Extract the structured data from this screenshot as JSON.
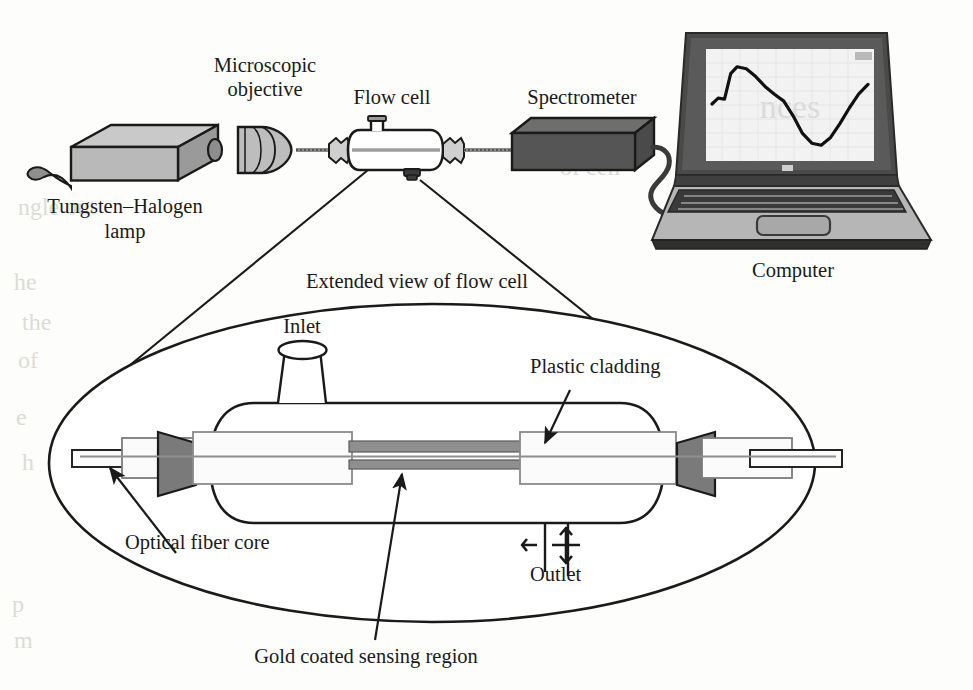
{
  "figure": {
    "domain": "scientific-diagram"
  },
  "labels": {
    "lamp": "Tungsten–Halogen",
    "lamp_line2": "lamp",
    "objective": "Microscopic",
    "objective_line2": "objective",
    "flow_cell": "Flow cell",
    "spectrometer": "Spectrometer",
    "computer": "Computer",
    "extended_view": "Extended view of flow cell",
    "inlet": "Inlet",
    "outlet": "Outlet",
    "plastic_cladding": "Plastic cladding",
    "optical_fiber_core": "Optical fiber core",
    "gold_region": "Gold coated sensing region"
  },
  "components": [
    {
      "id": "lamp",
      "name": "Tungsten–Halogen lamp",
      "kind": "light-source"
    },
    {
      "id": "objective",
      "name": "Microscopic objective",
      "kind": "lens"
    },
    {
      "id": "flow-cell",
      "name": "Flow cell",
      "kind": "cell"
    },
    {
      "id": "spectrometer",
      "name": "Spectrometer",
      "kind": "detector"
    },
    {
      "id": "computer",
      "name": "Computer",
      "kind": "laptop"
    }
  ],
  "callouts": [
    {
      "id": "inlet",
      "label": "Inlet",
      "target": "inlet-funnel"
    },
    {
      "id": "outlet",
      "label": "Outlet",
      "target": "outlet-ports"
    },
    {
      "id": "plastic-cladding",
      "label": "Plastic cladding",
      "target": "cladding-sleeve"
    },
    {
      "id": "fiber-core",
      "label": "Optical fiber core",
      "target": "fiber-core-rod"
    },
    {
      "id": "gold-region",
      "label": "Gold coated sensing region",
      "target": "gold-sensing-bar"
    }
  ],
  "colors": {
    "stroke": "#1a1a1a",
    "lamp_body": "#b9b9b9",
    "lamp_top": "#c9c9c9",
    "lamp_side": "#9a9a9a",
    "spectrometer_body": "#555555",
    "spectrometer_top": "#6e6e6e",
    "coupler_fill": "#7a7a7a",
    "gold_bar": "#8f8f8f",
    "cladding_fill": "#fbfbfb",
    "screen_bg": "#f2f2f2",
    "laptop_bezel": "#4a4a4a",
    "laptop_base": "#b6b6b6",
    "keys": "#3a3a3a",
    "paper": "#fdfdfb",
    "ghost_text": "#cfcac2"
  },
  "chart_data": {
    "type": "line",
    "xlabel": "Wavelength",
    "ylabel": "Transmitted intensity",
    "x": [
      0,
      4,
      8,
      12,
      16,
      22,
      28,
      34,
      40,
      46,
      52,
      58,
      64,
      70,
      76,
      82,
      88,
      94,
      100
    ],
    "y": [
      52,
      58,
      57,
      83,
      90,
      88,
      80,
      70,
      62,
      55,
      40,
      22,
      12,
      10,
      18,
      32,
      48,
      62,
      72
    ],
    "ylim": [
      0,
      100
    ],
    "xlim": [
      0,
      100
    ],
    "grid": true,
    "legend": false
  },
  "ghost_marks": [
    "ngle out",
    "he",
    "the"
  ]
}
